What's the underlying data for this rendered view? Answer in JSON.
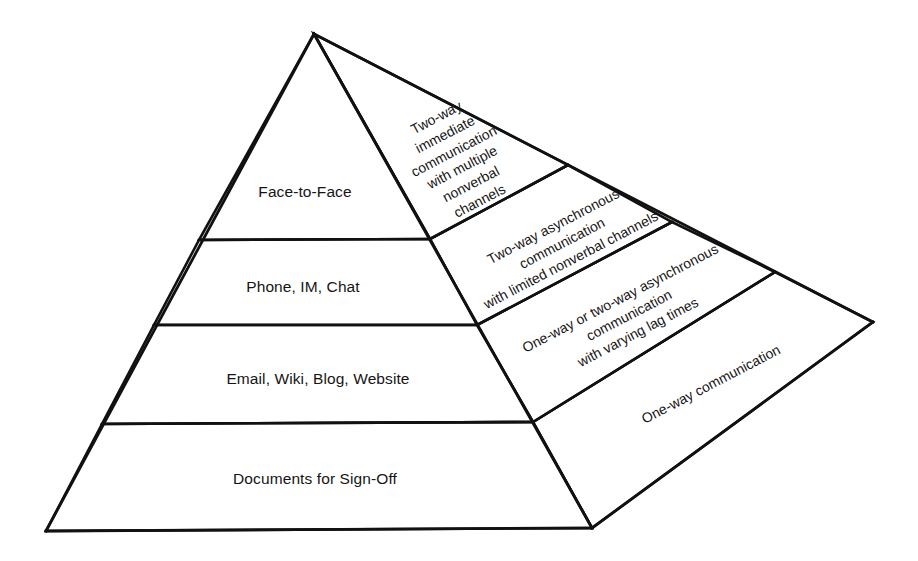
{
  "diagram": {
    "type": "3d-pyramid",
    "background_color": "#ffffff",
    "line_color": "#111111",
    "text_color": "#151515",
    "levels": [
      {
        "index": 1,
        "position": "top",
        "front_label": "Face-to-Face",
        "side_label_lines": [
          "Two-way",
          "immediate",
          "communication",
          "with multiple",
          "nonverbal",
          "channels"
        ]
      },
      {
        "index": 2,
        "position": "upper-middle",
        "front_label": "Phone, IM, Chat",
        "side_label_lines": [
          "Two-way asynchronous",
          "communication",
          "with limited nonverbal channels"
        ]
      },
      {
        "index": 3,
        "position": "lower-middle",
        "front_label": "Email, Wiki, Blog, Website",
        "side_label_lines": [
          "One-way or two-way asynchronous",
          "communication",
          "with varying lag times"
        ]
      },
      {
        "index": 4,
        "position": "bottom",
        "front_label": "Documents for Sign-Off",
        "side_label_lines": [
          "One-way communication"
        ]
      }
    ]
  }
}
